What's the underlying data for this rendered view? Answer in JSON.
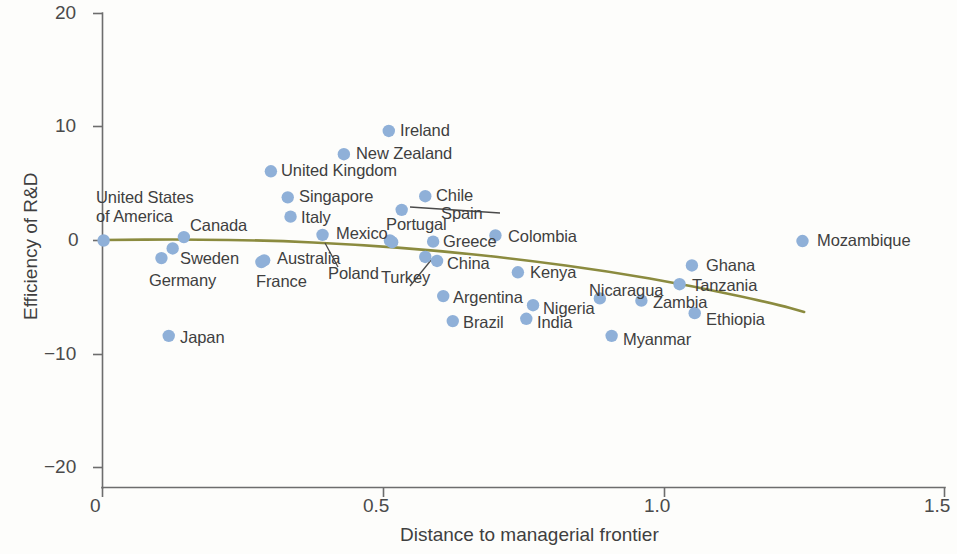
{
  "chart_data": {
    "type": "scatter",
    "title": "",
    "xlabel": "Distance to managerial frontier",
    "ylabel": "Efficiency of R&D",
    "xlim": [
      0,
      1.5
    ],
    "ylim": [
      -20,
      20
    ],
    "xticks": [
      "0",
      "0.5",
      "1.0",
      "1.5"
    ],
    "xtick_values": [
      0,
      0.5,
      1.0,
      1.5
    ],
    "yticks": [
      "20",
      "10",
      "0",
      "-10",
      "-20"
    ],
    "ytick_values": [
      20,
      10,
      0,
      -10,
      -20
    ],
    "grid": false,
    "legend": "none",
    "marker_color": "#8fb0d8",
    "trend_color": "#8b8b3f",
    "axis_color": "#6d6d6d",
    "points": [
      {
        "label": "United States of America",
        "x": 0.002,
        "y": 0.0
      },
      {
        "label": "Germany",
        "x": 0.105,
        "y": -1.55
      },
      {
        "label": "Sweden",
        "x": 0.125,
        "y": -0.7
      },
      {
        "label": "Canada",
        "x": 0.145,
        "y": 0.3
      },
      {
        "label": "Japan",
        "x": 0.118,
        "y": -8.4
      },
      {
        "label": "France",
        "x": 0.283,
        "y": -1.9
      },
      {
        "label": "Australia",
        "x": 0.288,
        "y": -1.75
      },
      {
        "label": "United Kingdom",
        "x": 0.3,
        "y": 6.1
      },
      {
        "label": "Singapore",
        "x": 0.33,
        "y": 3.8
      },
      {
        "label": "Italy",
        "x": 0.335,
        "y": 2.1
      },
      {
        "label": "Poland",
        "x": 0.392,
        "y": 0.5
      },
      {
        "label": "New Zealand",
        "x": 0.43,
        "y": 7.6
      },
      {
        "label": "Ireland",
        "x": 0.51,
        "y": 9.65
      },
      {
        "label": "Spain",
        "x": 0.533,
        "y": 2.7
      },
      {
        "label": "Chile",
        "x": 0.575,
        "y": 3.9
      },
      {
        "label": "Mexico",
        "x": 0.512,
        "y": 0.0
      },
      {
        "label": "Portugal",
        "x": 0.516,
        "y": -0.15
      },
      {
        "label": "Greece",
        "x": 0.589,
        "y": -0.1
      },
      {
        "label": "Turkey",
        "x": 0.575,
        "y": -1.45
      },
      {
        "label": "China",
        "x": 0.596,
        "y": -1.8
      },
      {
        "label": "Colombia",
        "x": 0.7,
        "y": 0.45
      },
      {
        "label": "Argentina",
        "x": 0.607,
        "y": -4.9
      },
      {
        "label": "Brazil",
        "x": 0.624,
        "y": -7.1
      },
      {
        "label": "Kenya",
        "x": 0.74,
        "y": -2.8
      },
      {
        "label": "Nigeria",
        "x": 0.767,
        "y": -5.7
      },
      {
        "label": "India",
        "x": 0.755,
        "y": -6.9
      },
      {
        "label": "Nicaragua",
        "x": 0.886,
        "y": -5.1
      },
      {
        "label": "Myanmar",
        "x": 0.907,
        "y": -8.4
      },
      {
        "label": "Zambia",
        "x": 0.96,
        "y": -5.3
      },
      {
        "label": "Tanzania",
        "x": 1.028,
        "y": -3.85
      },
      {
        "label": "Ghana",
        "x": 1.05,
        "y": -2.2
      },
      {
        "label": "Ethiopia",
        "x": 1.055,
        "y": -6.4
      },
      {
        "label": "Mozambique",
        "x": 1.247,
        "y": -0.05
      }
    ],
    "trend_line": {
      "description": "fitted quadratic trend, slightly declining then falling",
      "points": [
        {
          "x": 0.0,
          "y": 0.05
        },
        {
          "x": 0.15,
          "y": 0.1
        },
        {
          "x": 0.3,
          "y": 0.0
        },
        {
          "x": 0.45,
          "y": -0.35
        },
        {
          "x": 0.6,
          "y": -0.9
        },
        {
          "x": 0.75,
          "y": -1.7
        },
        {
          "x": 0.9,
          "y": -2.7
        },
        {
          "x": 1.05,
          "y": -4.0
        },
        {
          "x": 1.2,
          "y": -5.6
        },
        {
          "x": 1.25,
          "y": -6.3
        }
      ]
    },
    "leader_lines": [
      {
        "from_label": "Spain",
        "to_point": "Spain"
      },
      {
        "from_label": "Poland",
        "to_point": "Poland"
      },
      {
        "from_label": "Turkey",
        "to_point": "Turkey"
      }
    ]
  },
  "labels": {
    "usa_line1": "United States",
    "usa_line2": "of America",
    "canada": "Canada",
    "sweden": "Sweden",
    "germany": "Germany",
    "japan": "Japan",
    "australia": "Australia",
    "france": "France",
    "united_kingdom": "United Kingdom",
    "singapore": "Singapore",
    "italy": "Italy",
    "poland": "Poland",
    "new_zealand": "New Zealand",
    "ireland": "Ireland",
    "chile": "Chile",
    "spain": "Spain",
    "mexico": "Mexico",
    "portugal": "Portugal",
    "greece": "Greece",
    "colombia": "Colombia",
    "turkey": "Turkey",
    "china": "China",
    "kenya": "Kenya",
    "argentina": "Argentina",
    "brazil": "Brazil",
    "nigeria": "Nigeria",
    "india": "India",
    "nicaragua": "Nicaragua",
    "myanmar": "Myanmar",
    "zambia": "Zambia",
    "tanzania": "Tanzania",
    "ghana": "Ghana",
    "ethiopia": "Ethiopia",
    "mozambique": "Mozambique"
  },
  "axes": {
    "x_title": "Distance to managerial frontier",
    "y_title": "Efficiency of R&D",
    "x_tick_0": "0",
    "x_tick_1": "0.5",
    "x_tick_2": "1.0",
    "x_tick_3": "1.5",
    "y_tick_0": "20",
    "y_tick_1": "10",
    "y_tick_2": "0",
    "y_tick_3": "−10",
    "y_tick_4": "−20"
  }
}
